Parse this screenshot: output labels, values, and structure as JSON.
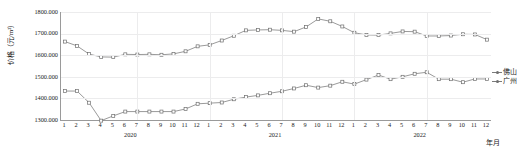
{
  "chart_data": {
    "type": "line",
    "title": "",
    "xlabel": "年月",
    "ylabel": "价格（元/m²）",
    "ylim": [
      1300.0,
      1800.0
    ],
    "grid": true,
    "legend_position": "right",
    "y_ticks": [
      "1300.000",
      "1400.000",
      "1500.000",
      "1600.000",
      "1700.000",
      "1800.000"
    ],
    "y_tick_values": [
      1300.0,
      1400.0,
      1500.0,
      1600.0,
      1700.0,
      1800.0
    ],
    "categories": [
      "2020-1",
      "2020-2",
      "2020-3",
      "2020-4",
      "2020-5",
      "2020-6",
      "2020-7",
      "2020-8",
      "2020-9",
      "2020-10",
      "2020-11",
      "2020-12",
      "2021-1",
      "2021-2",
      "2021-3",
      "2021-4",
      "2021-5",
      "2021-6",
      "2021-7",
      "2021-8",
      "2021-9",
      "2021-10",
      "2021-11",
      "2021-12",
      "2022-1",
      "2022-2",
      "2022-3",
      "2022-4",
      "2022-5",
      "2022-6",
      "2022-7",
      "2022-8",
      "2022-9",
      "2022-10",
      "2022-11",
      "2022-12"
    ],
    "month_ticks": [
      "1",
      "2",
      "3",
      "4",
      "5",
      "6",
      "7",
      "8",
      "9",
      "10",
      "11",
      "12",
      "1",
      "2",
      "3",
      "4",
      "5",
      "6",
      "7",
      "8",
      "9",
      "10",
      "11",
      "12",
      "1",
      "2",
      "3",
      "4",
      "5",
      "6",
      "7",
      "8",
      "9",
      "10",
      "11",
      "12"
    ],
    "year_groups": [
      {
        "label": "2020",
        "start_index": 0,
        "end_index": 11
      },
      {
        "label": "2021",
        "start_index": 12,
        "end_index": 23
      },
      {
        "label": "2022",
        "start_index": 24,
        "end_index": 35
      }
    ],
    "series": [
      {
        "name": "佛山",
        "color": "#6f6f6f",
        "values": [
          1663.0,
          1643.0,
          1605.0,
          1592.0,
          1591.0,
          1604.0,
          1603.0,
          1604.0,
          1602.0,
          1606.0,
          1618.0,
          1641.0,
          1648.0,
          1668.0,
          1690.0,
          1715.0,
          1717.0,
          1718.0,
          1715.0,
          1709.0,
          1731.0,
          1768.0,
          1757.0,
          1733.0,
          1704.0,
          1694.0,
          1693.0,
          1701.0,
          1710.0,
          1709.0,
          1689.0,
          1689.0,
          1691.0,
          1697.0,
          1696.0,
          1672.0
        ]
      },
      {
        "name": "广州",
        "color": "#6f6f6f",
        "values": [
          1434.0,
          1434.0,
          1380.0,
          1297.0,
          1319.0,
          1339.0,
          1339.0,
          1339.0,
          1339.0,
          1339.0,
          1351.0,
          1375.0,
          1378.0,
          1381.0,
          1396.0,
          1406.0,
          1414.0,
          1424.0,
          1433.0,
          1446.0,
          1461.0,
          1450.0,
          1459.0,
          1477.0,
          1466.0,
          1487.0,
          1508.0,
          1489.0,
          1500.0,
          1514.0,
          1521.0,
          1489.0,
          1489.0,
          1475.0,
          1490.0,
          1490.0
        ]
      }
    ]
  },
  "legend": {
    "items": [
      {
        "label": "佛山"
      },
      {
        "label": "广州"
      }
    ]
  },
  "axis": {
    "x_unit": "年月",
    "y_title": "价格（元/m²）"
  }
}
